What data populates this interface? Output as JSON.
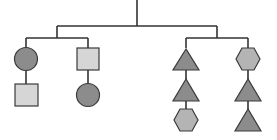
{
  "diagram": {
    "type": "tree",
    "colors": {
      "line": "#333333",
      "dark_fill": "#8c8c8c",
      "light_fill": "#d6d6d6",
      "hex_fill": "#b4b4b4",
      "stroke": "#3a3a3a"
    },
    "root": {
      "children": [
        {
          "name": "left-group",
          "children": [
            {
              "name": "column-1",
              "shapes": [
                "circle-dark",
                "square-light"
              ]
            },
            {
              "name": "column-2",
              "shapes": [
                "square-light",
                "circle-dark"
              ]
            }
          ]
        },
        {
          "name": "right-group",
          "children": [
            {
              "name": "column-3",
              "shapes": [
                "triangle-dark",
                "triangle-dark",
                "hexagon-mid"
              ]
            },
            {
              "name": "column-4",
              "shapes": [
                "hexagon-mid",
                "triangle-dark",
                "triangle-dark"
              ]
            }
          ]
        }
      ]
    }
  }
}
